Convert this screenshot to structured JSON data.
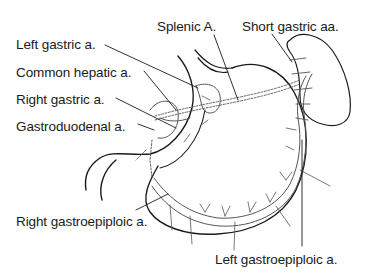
{
  "diagram": {
    "colors": {
      "line": "#1a1a1a",
      "vessel": "#555555",
      "background": "#ffffff"
    },
    "labels": [
      {
        "id": "left-gastric",
        "text": "Left gastric a.",
        "x": 16,
        "y": 38
      },
      {
        "id": "splenic",
        "text": "Splenic A.",
        "x": 157,
        "y": 20
      },
      {
        "id": "short-gastric",
        "text": "Short gastric aa.",
        "x": 242,
        "y": 20
      },
      {
        "id": "common-hepatic",
        "text": "Common hepatic a.",
        "x": 16,
        "y": 66
      },
      {
        "id": "right-gastric",
        "text": "Right gastric a.",
        "x": 16,
        "y": 93
      },
      {
        "id": "gastroduodenal",
        "text": "Gastroduodenal a.",
        "x": 16,
        "y": 120
      },
      {
        "id": "right-gastroepiploic",
        "text": "Right gastroepiploic a.",
        "x": 16,
        "y": 215
      },
      {
        "id": "left-gastroepiploic",
        "text": "Left gastroepiploic a.",
        "x": 215,
        "y": 253
      }
    ],
    "structures": [
      "stomach",
      "spleen",
      "duodenum",
      "liver-edge"
    ]
  }
}
